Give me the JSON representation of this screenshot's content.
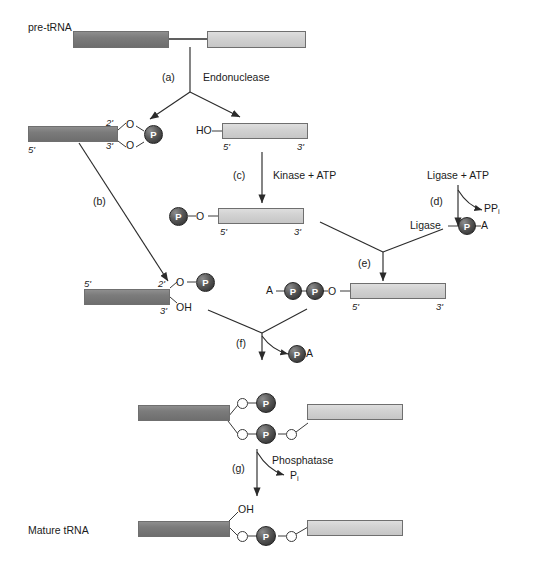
{
  "figure": {
    "title_label": "pre-tRNA",
    "final_label": "Mature tRNA",
    "atoms": {
      "phosphate": "P",
      "oxygen": "O",
      "hydroxyl": "OH",
      "ho": "HO",
      "adenosine": "A"
    },
    "primes": {
      "five": "5'",
      "three": "3'",
      "two": "2'",
      "three_b": "3'"
    }
  },
  "steps": [
    {
      "id": "a",
      "tag": "(a)",
      "enzyme": "Endonuclease",
      "byproduct": ""
    },
    {
      "id": "b",
      "tag": "(b)",
      "enzyme": "",
      "byproduct": ""
    },
    {
      "id": "c",
      "tag": "(c)",
      "enzyme": "Kinase + ATP",
      "byproduct": ""
    },
    {
      "id": "d",
      "tag": "(d)",
      "enzyme": "Ligase + ATP",
      "byproduct": "PP"
    },
    {
      "id": "e",
      "tag": "(e)",
      "enzyme": "",
      "byproduct": ""
    },
    {
      "id": "f",
      "tag": "(f)",
      "enzyme": "",
      "byproduct": "A"
    },
    {
      "id": "g",
      "tag": "(g)",
      "enzyme": "Phosphatase",
      "byproduct": "P"
    }
  ],
  "labels": {
    "pre_trna": "pre-tRNA",
    "endonuclease": "Endonuclease",
    "kinase_atp": "Kinase + ATP",
    "ligase_atp": "Ligase + ATP",
    "ligase": "Ligase",
    "phosphatase": "Phosphatase",
    "ppi": "PP",
    "ppi_sub": "i",
    "pi": "P",
    "pi_sub": "i",
    "mature_trna": "Mature tRNA",
    "step_a": "(a)",
    "step_b": "(b)",
    "step_c": "(c)",
    "step_d": "(d)",
    "step_e": "(e)",
    "step_f": "(f)",
    "step_g": "(g)",
    "p": "P",
    "o": "O",
    "oh": "OH",
    "ho": "HO",
    "a": "A",
    "five_prime": "5'",
    "three_prime": "3'",
    "two_prime": "2'"
  },
  "colors": {
    "exon5_dark": "#7b7b7b",
    "exon3_light": "#d2d2d2",
    "phosphate_fill": "#3a3a3a",
    "stroke": "#2b2b2b",
    "text": "#1b1b1b",
    "background": "#ffffff"
  }
}
